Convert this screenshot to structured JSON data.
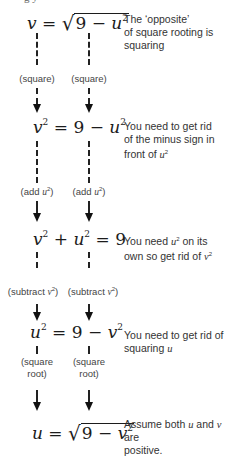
{
  "top_fragment": "g          y",
  "steps": [
    {
      "equation": {
        "lhs": "v",
        "rhs_sqrt_const": "9",
        "rhs_sqrt_var": "u",
        "rhs_sqrt_exp": "2"
      },
      "note": {
        "line1": "The ‘opposite’",
        "line2": "of square rooting is",
        "line3": "squaring"
      }
    },
    {
      "operation": {
        "left": "(square)",
        "right": "(square)"
      }
    },
    {
      "equation": {
        "lhs_var": "v",
        "lhs_exp": "2",
        "rhs_const": "9",
        "rhs_var": "u",
        "rhs_exp": "2"
      },
      "note": {
        "line1": "You need to get rid",
        "line2": "of the minus sign in",
        "line3_text": "front of ",
        "line3_var": "u",
        "line3_exp": "2"
      }
    },
    {
      "operation": {
        "left_text": "(add ",
        "left_var": "u",
        "left_exp": "2",
        "left_close": ")",
        "right_text": "(add ",
        "right_var": "u",
        "right_exp": "2",
        "right_close": ")"
      }
    },
    {
      "equation": {
        "a_var": "v",
        "a_exp": "2",
        "b_var": "u",
        "b_exp": "2",
        "rhs": "9"
      },
      "note": {
        "line1_text": "You need ",
        "line1_var": "u",
        "line1_exp": "2",
        "line1_tail": " on its",
        "line2_text": "own so get rid of ",
        "line2_var": "v",
        "line2_exp": "2"
      }
    },
    {
      "operation": {
        "left_text": "(subtract ",
        "left_var": "v",
        "left_exp": "2",
        "left_close": ")",
        "right_text": "(subtract ",
        "right_var": "v",
        "right_exp": "2",
        "right_close": ")"
      }
    },
    {
      "equation": {
        "lhs_var": "u",
        "lhs_exp": "2",
        "rhs_const": "9",
        "rhs_var": "v",
        "rhs_exp": "2"
      },
      "note": {
        "line1": "You need to get rid of",
        "line2_text": "squaring ",
        "line2_var": "u"
      }
    },
    {
      "operation": {
        "left_line1": "(square",
        "left_line2": "root)",
        "right_line1": "(square",
        "right_line2": "root)"
      }
    },
    {
      "equation": {
        "lhs": "u",
        "rhs_sqrt_const": "9",
        "rhs_sqrt_var": "v",
        "rhs_sqrt_exp": "2"
      },
      "note": {
        "line1_text": "Assume both ",
        "line1_var1": "u",
        "line1_mid": " and ",
        "line1_var2": "v",
        "line1_tail": " are",
        "line2": "positive."
      }
    }
  ],
  "symbols": {
    "equals": "=",
    "minus": "−",
    "plus": "+",
    "radical": "√"
  }
}
